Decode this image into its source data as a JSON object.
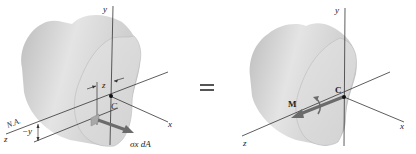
{
  "figure": {
    "left_panel": {
      "labels": {
        "axis_y": "y",
        "axis_x": "x",
        "axis_z": "z",
        "centroid": "C",
        "neutral_axis": "N.A.",
        "z_offset": "z",
        "y_offset": "−y",
        "stress_force": "σx dA"
      }
    },
    "equals_sign": "=",
    "right_panel": {
      "labels": {
        "axis_y": "y",
        "axis_x": "x",
        "axis_z": "z",
        "centroid": "C",
        "moment": "M"
      }
    },
    "colors": {
      "body_light": "#e6e6e6",
      "body_mid": "#cfcfcf",
      "body_dark": "#b8b8b8",
      "face": "#dcdcdc",
      "line": "#333333",
      "arrow": "#6b6b6b"
    }
  }
}
